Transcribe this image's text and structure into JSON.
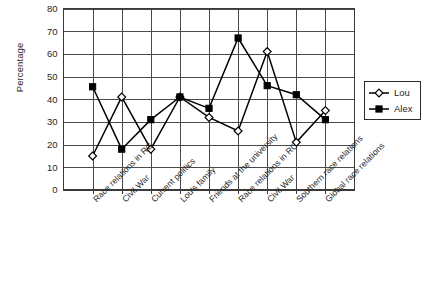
{
  "chart_data": {
    "type": "line",
    "title": "",
    "xlabel": "",
    "ylabel": "Percentage",
    "ylim": [
      0,
      80
    ],
    "yticks": [
      0,
      10,
      20,
      30,
      40,
      50,
      60,
      70,
      80
    ],
    "grid": true,
    "legend_position": "right",
    "categories": [
      "Race relations in RC",
      "Civil War",
      "Current politics",
      "Lou's family",
      "Friends at the university",
      "Race relations in RC",
      "Civil War",
      "Southern race relations",
      "Global race relations"
    ],
    "series": [
      {
        "name": "Lou",
        "marker": "open-diamond",
        "color": "#000000",
        "values": [
          15,
          41,
          18,
          41,
          32,
          26,
          61,
          21,
          35
        ]
      },
      {
        "name": "Alex",
        "marker": "filled-square",
        "color": "#000000",
        "values": [
          45.5,
          18,
          31,
          41,
          36,
          67,
          46,
          42,
          31
        ]
      }
    ]
  },
  "legend": {
    "entries": [
      {
        "label": "Lou"
      },
      {
        "label": "Alex"
      }
    ]
  },
  "axes": {
    "y_title": "Percentage"
  }
}
